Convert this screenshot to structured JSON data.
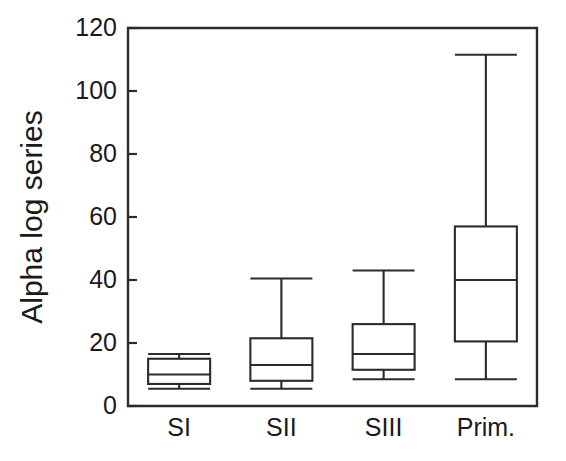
{
  "chart_data": {
    "type": "box",
    "title": "",
    "xlabel": "",
    "ylabel": "Alpha log series",
    "ylim": [
      0,
      120
    ],
    "ytick_step": 20,
    "yticks": [
      0,
      20,
      40,
      60,
      80,
      100,
      120
    ],
    "ytick_labels": [
      "0",
      "20",
      "40",
      "60",
      "80",
      "100",
      "120"
    ],
    "categories": [
      "SI",
      "SII",
      "SIII",
      "Prim."
    ],
    "grid": false,
    "legend": false,
    "boxes": [
      {
        "category": "SI",
        "whisker_low": 5.5,
        "q1": 7.0,
        "median": 10.0,
        "q3": 15.0,
        "whisker_high": 16.5
      },
      {
        "category": "SII",
        "whisker_low": 5.5,
        "q1": 8.0,
        "median": 13.0,
        "q3": 21.5,
        "whisker_high": 40.5
      },
      {
        "category": "SIII",
        "whisker_low": 8.5,
        "q1": 11.5,
        "median": 16.5,
        "q3": 26.0,
        "whisker_high": 43.0
      },
      {
        "category": "Prim.",
        "whisker_low": 8.5,
        "q1": 20.5,
        "median": 40.0,
        "q3": 57.0,
        "whisker_high": 111.5
      }
    ],
    "colors": {
      "line": "#2b2b2b",
      "fill": "#ffffff",
      "text": "#1a1a1a",
      "background": "#ffffff"
    }
  }
}
